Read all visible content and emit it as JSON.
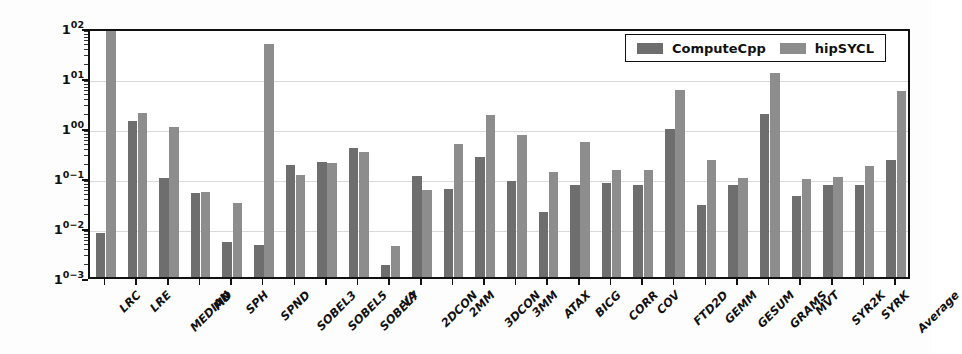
{
  "chart_data": {
    "type": "bar",
    "title": "",
    "xlabel": "",
    "ylabel": "Execution Time [s]",
    "yscale": "log",
    "ylim": [
      0.001,
      100
    ],
    "ytick_labels": [
      "10²",
      "10¹",
      "10⁰",
      "10⁻¹",
      "10⁻²",
      "10⁻³"
    ],
    "ytick_values": [
      100,
      10,
      1,
      0.1,
      0.01,
      0.001
    ],
    "grid": true,
    "legend_position": "upper right",
    "categories": [
      "LRC",
      "LRE",
      "MEDIAN",
      "MD",
      "SPH",
      "SPND",
      "SOBEL3",
      "SOBEL5",
      "SOBEL7",
      "VA",
      "2DCON",
      "2MM",
      "3DCON",
      "3MM",
      "ATAX",
      "BICG",
      "CORR",
      "COV",
      "FTD2D",
      "GEMM",
      "GESUM",
      "GRAMS",
      "MVT",
      "SYR2K",
      "SYRK",
      "Average"
    ],
    "series": [
      {
        "name": "ComputeCpp",
        "color": "#6e6e6e",
        "values": [
          0.0075,
          1.3,
          0.095,
          0.047,
          0.005,
          0.0044,
          0.17,
          0.2,
          0.38,
          0.0017,
          0.105,
          0.058,
          0.25,
          0.085,
          0.02,
          0.07,
          0.075,
          0.07,
          0.93,
          0.027,
          0.07,
          1.85,
          0.042,
          0.07,
          0.07,
          0.22
        ]
      },
      {
        "name": "hipSYCL",
        "color": "#8d8d8d",
        "values": [
          120,
          1.9,
          1.02,
          0.051,
          0.03,
          46,
          0.11,
          0.19,
          0.31,
          0.0042,
          0.054,
          0.46,
          1.75,
          0.68,
          0.125,
          0.5,
          0.14,
          0.135,
          5.6,
          0.22,
          0.095,
          12.0,
          0.09,
          0.1,
          0.165,
          5.3
        ]
      }
    ]
  },
  "legend": {
    "entries": [
      {
        "label": "ComputeCpp",
        "color": "#6e6e6e"
      },
      {
        "label": "hipSYCL",
        "color": "#8d8d8d"
      }
    ]
  },
  "axes": {
    "y_title": "Execution Time [s]"
  }
}
